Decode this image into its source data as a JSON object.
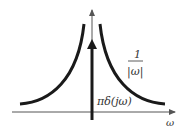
{
  "figure": {
    "curve_label_numerator": "1",
    "curve_label_denominator": "|ω|",
    "impulse_label": "πδ(jω)",
    "x_axis_label": "ω"
  },
  "colors": {
    "curve": "#1a1a1a",
    "axis": "#555555",
    "text": "#333333"
  }
}
